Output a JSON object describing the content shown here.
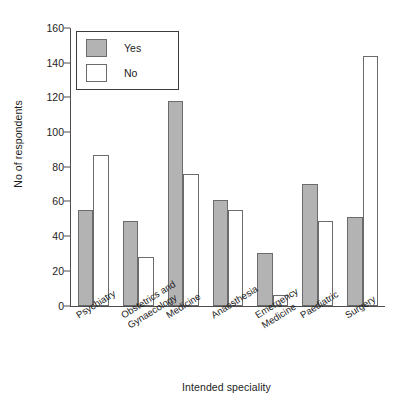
{
  "chart_data": {
    "type": "bar",
    "title": "",
    "xlabel": "Intended speciality",
    "ylabel": "No of respondents",
    "ylim": [
      0,
      160
    ],
    "yticks": [
      0,
      20,
      40,
      60,
      80,
      100,
      120,
      140,
      160
    ],
    "grid": false,
    "legend_position": "top-left",
    "categories": [
      "Psychiatry",
      "Obstetrics and Gynaecology",
      "Medicine",
      "Anaesthesia",
      "Emergency Medicine",
      "Paediatric",
      "Surgery"
    ],
    "category_lines": [
      [
        "Psychiatry"
      ],
      [
        "Obstetrics and",
        "Gynaecology"
      ],
      [
        "Medicine"
      ],
      [
        "Anaesthesia"
      ],
      [
        "Emergency",
        "Medicine"
      ],
      [
        "Paediatric"
      ],
      [
        "Surgery"
      ]
    ],
    "series": [
      {
        "name": "Yes",
        "color": "#b3b3b3",
        "values": [
          55,
          49,
          118,
          61,
          30,
          70,
          51
        ]
      },
      {
        "name": "No",
        "color": "#ffffff",
        "values": [
          87,
          28,
          76,
          55,
          6,
          49,
          144
        ]
      }
    ]
  },
  "legend": {
    "items": [
      {
        "label": "Yes",
        "swatch": "yes"
      },
      {
        "label": "No",
        "swatch": "no"
      }
    ]
  }
}
